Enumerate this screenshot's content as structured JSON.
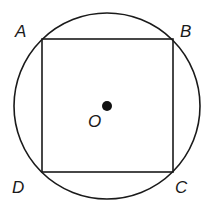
{
  "diagram": {
    "circle": {
      "center": "O",
      "cx": 107,
      "cy": 106,
      "r": 93
    },
    "square": {
      "vertices": [
        "A",
        "B",
        "C",
        "D"
      ]
    },
    "points": [
      {
        "name": "A",
        "x": 42,
        "y": 39,
        "label_x": 15,
        "label_y": 36
      },
      {
        "name": "B",
        "x": 173,
        "y": 39,
        "label_x": 180,
        "label_y": 36
      },
      {
        "name": "C",
        "x": 173,
        "y": 172,
        "label_x": 176,
        "label_y": 192
      },
      {
        "name": "D",
        "x": 42,
        "y": 172,
        "label_x": 14,
        "label_y": 192
      }
    ],
    "center_label": "O",
    "labels": {
      "A": "A",
      "B": "B",
      "C": "C",
      "D": "D",
      "O": "O"
    },
    "colors": {
      "stroke": "#1a1a1a",
      "background": "#ffffff"
    }
  }
}
